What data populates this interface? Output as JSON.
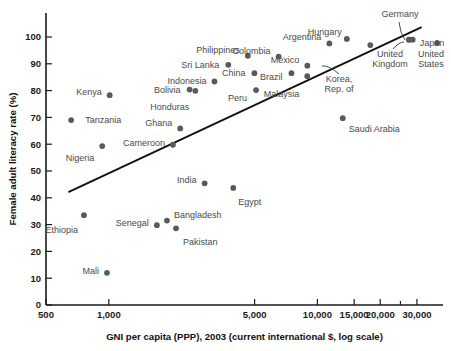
{
  "chart_data": {
    "type": "scatter",
    "title": "",
    "xlabel": "GNI per capita (PPP), 2003 (current international $, log scale)",
    "ylabel": "Female adult literacy rate (%)",
    "xscale": "log",
    "xlim": [
      500,
      40000
    ],
    "ylim": [
      0,
      107
    ],
    "grid": false,
    "legend": "none",
    "xticks": [
      {
        "value": 500,
        "label": "500",
        "major": true
      },
      {
        "value": 1000,
        "label": "1,000",
        "major": true
      },
      {
        "value": 5000,
        "label": "5,000",
        "major": true
      },
      {
        "value": 10000,
        "label": "10,000",
        "major": true
      },
      {
        "value": 15000,
        "label": "15,000",
        "major": true
      },
      {
        "value": 20000,
        "label": "20,000",
        "major": true
      },
      {
        "value": 25000,
        "label": "",
        "major": false
      },
      {
        "value": 30000,
        "label": "30,000",
        "major": true
      }
    ],
    "yticks": [
      {
        "value": 0,
        "label": "0"
      },
      {
        "value": 10,
        "label": "10"
      },
      {
        "value": 20,
        "label": "20"
      },
      {
        "value": 30,
        "label": "30"
      },
      {
        "value": 40,
        "label": "40"
      },
      {
        "value": 50,
        "label": "50"
      },
      {
        "value": 60,
        "label": "60"
      },
      {
        "value": 70,
        "label": "70"
      },
      {
        "value": 80,
        "label": "80"
      },
      {
        "value": 90,
        "label": "90"
      },
      {
        "value": 100,
        "label": "100"
      }
    ],
    "points": [
      {
        "label": "Tanzania",
        "x": 660,
        "y": 69.0,
        "lx": 14,
        "ly": 0,
        "anchor": "start"
      },
      {
        "label": "Ethiopia",
        "x": 760,
        "y": 33.5,
        "lx": -6,
        "ly": 15,
        "anchor": "end"
      },
      {
        "label": "Mali",
        "x": 980,
        "y": 12.0,
        "lx": -8,
        "ly": -2,
        "anchor": "end"
      },
      {
        "label": "Nigeria",
        "x": 930,
        "y": 59.3,
        "lx": -8,
        "ly": 12,
        "anchor": "end"
      },
      {
        "label": "Kenya",
        "x": 1010,
        "y": 78.3,
        "lx": -8,
        "ly": -3,
        "anchor": "end"
      },
      {
        "label": "Senegal",
        "x": 1700,
        "y": 29.8,
        "lx": -8,
        "ly": -2,
        "anchor": "end"
      },
      {
        "label": "Bangladesh",
        "x": 1900,
        "y": 31.5,
        "lx": 7,
        "ly": -6,
        "anchor": "start"
      },
      {
        "label": "Pakistan",
        "x": 2100,
        "y": 28.6,
        "lx": 7,
        "ly": 13,
        "anchor": "start"
      },
      {
        "label": "Cameroon",
        "x": 2030,
        "y": 59.8,
        "lx": -8,
        "ly": -2,
        "anchor": "end"
      },
      {
        "label": "Ghana",
        "x": 2200,
        "y": 65.9,
        "lx": -8,
        "ly": -6,
        "anchor": "end"
      },
      {
        "label": "Bolivia",
        "x": 2440,
        "y": 80.4,
        "lx": -9,
        "ly": 0,
        "anchor": "end"
      },
      {
        "label": "Honduras",
        "x": 2600,
        "y": 79.9,
        "lx": -6,
        "ly": 16,
        "anchor": "end"
      },
      {
        "label": "India",
        "x": 2880,
        "y": 45.4,
        "lx": -8,
        "ly": -4,
        "anchor": "end"
      },
      {
        "label": "Indonesia",
        "x": 3210,
        "y": 83.4,
        "lx": -8,
        "ly": -1,
        "anchor": "end"
      },
      {
        "label": "Sri Lanka",
        "x": 3740,
        "y": 89.6,
        "lx": -9,
        "ly": 0,
        "anchor": "end"
      },
      {
        "label": "Egypt",
        "x": 3950,
        "y": 43.7,
        "lx": 5,
        "ly": 14,
        "anchor": "start"
      },
      {
        "label": "Philippines",
        "x": 4640,
        "y": 93.0,
        "lx": -8,
        "ly": -6,
        "anchor": "end"
      },
      {
        "label": "China",
        "x": 4990,
        "y": 86.5,
        "lx": -9,
        "ly": 0,
        "anchor": "end"
      },
      {
        "label": "Peru",
        "x": 5080,
        "y": 80.2,
        "lx": -9,
        "ly": 8,
        "anchor": "end"
      },
      {
        "label": "Colombia",
        "x": 6520,
        "y": 92.7,
        "lx": -8,
        "ly": -6,
        "anchor": "end"
      },
      {
        "label": "Brazil",
        "x": 7510,
        "y": 86.5,
        "lx": -9,
        "ly": 4,
        "anchor": "end"
      },
      {
        "label": "Mexico",
        "x": 8950,
        "y": 89.3,
        "lx": -8,
        "ly": -6,
        "anchor": "end"
      },
      {
        "label": "Malaysia",
        "x": 8940,
        "y": 85.4,
        "lx": -8,
        "ly": 18,
        "anchor": "end"
      },
      {
        "label": "Argentina",
        "x": 11410,
        "y": 97.6,
        "lx": -8,
        "ly": -7,
        "anchor": "end"
      },
      {
        "label": "Saudi Arabia",
        "x": 13230,
        "y": 69.7,
        "lx": 6,
        "ly": 11,
        "anchor": "start"
      },
      {
        "label": "Hungary",
        "x": 13840,
        "y": 99.3,
        "lx": -5,
        "ly": -7,
        "anchor": "end"
      },
      {
        "label": "Korea, Rep. of",
        "x": 17930,
        "y": 97.0,
        "lx": 0,
        "ly": 0,
        "anchor": "middle"
      },
      {
        "label": "Germany",
        "x": 27550,
        "y": 99.0,
        "lx": 0,
        "ly": 0,
        "anchor": "middle"
      },
      {
        "label": "United Kingdom",
        "x": 27430,
        "y": 99.0,
        "lx": 0,
        "ly": 0,
        "anchor": "middle"
      },
      {
        "label": "Japan",
        "x": 28620,
        "y": 99.0,
        "lx": 7,
        "ly": 3,
        "anchor": "start"
      },
      {
        "label": "United States",
        "x": 37500,
        "y": 97.8,
        "lx": 0,
        "ly": 0,
        "anchor": "middle"
      }
    ],
    "trend_line": {
      "x0": 640,
      "y0": 42.1,
      "x1": 31600,
      "y1": 103.7
    },
    "multiline_labels": [
      {
        "text": "Korea,",
        "px": 339,
        "py": 82,
        "anchor": "middle"
      },
      {
        "text": "Rep. of",
        "px": 339,
        "py": 92,
        "anchor": "middle"
      },
      {
        "text": "United",
        "px": 390,
        "py": 57,
        "anchor": "middle"
      },
      {
        "text": "Kingdom",
        "px": 390,
        "py": 67,
        "anchor": "middle"
      },
      {
        "text": "Germany",
        "px": 400,
        "py": 17,
        "anchor": "middle"
      },
      {
        "text": "United",
        "px": 431,
        "py": 57,
        "anchor": "middle"
      },
      {
        "text": "States",
        "px": 431,
        "py": 67,
        "anchor": "middle"
      }
    ],
    "leader_lines": [
      {
        "x1": 339,
        "y1": 74,
        "x2": 329,
        "y2": 65,
        "x3": 322,
        "y3": 66
      },
      {
        "x1": 393,
        "y1": 49,
        "x2": 399,
        "y2": 42,
        "x3": 404,
        "y3": 42
      },
      {
        "x1": 399,
        "y1": 22,
        "x2": 400,
        "y2": 33,
        "x3": 405,
        "y3": 40
      }
    ]
  }
}
